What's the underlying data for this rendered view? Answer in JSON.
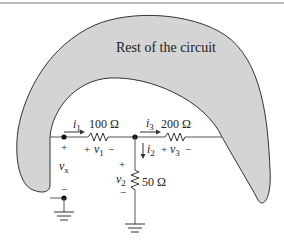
{
  "diagram": {
    "region_label": "Rest of the circuit",
    "colors": {
      "region_fill": "#d4d4d4",
      "stroke": "#333333",
      "wire": "#555555",
      "top_rule": "#777777"
    },
    "components": {
      "r1": {
        "value": "100 Ω",
        "current": "i",
        "current_sub": "1",
        "voltage_plus": "+",
        "voltage": "v",
        "voltage_sub": "1",
        "voltage_minus": "−"
      },
      "r3": {
        "value": "200 Ω",
        "current": "i",
        "current_sub": "3",
        "voltage_plus": "+",
        "voltage": "v",
        "voltage_sub": "3",
        "voltage_minus": "−"
      },
      "r2": {
        "value": "50 Ω",
        "current": "i",
        "current_sub": "2",
        "voltage_plus": "+",
        "voltage": "v",
        "voltage_sub": "2",
        "voltage_minus": "−"
      }
    },
    "port": {
      "voltage": "v",
      "voltage_sub": "x",
      "plus": "+",
      "minus": "−"
    }
  }
}
